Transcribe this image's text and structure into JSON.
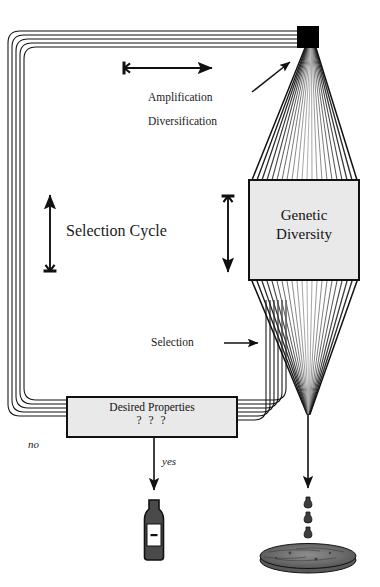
{
  "figure": {
    "labels": {
      "amplification": "Amplification",
      "diversification": "Diversification",
      "selection_cycle": "Selection Cycle",
      "selection": "Selection",
      "no": "no",
      "yes": "yes"
    },
    "boxes": {
      "genetic_diversity": {
        "line1": "Genetic",
        "line2": "Diversity"
      },
      "desired_properties": {
        "line1": "Desired Properties",
        "line2": "? ? ?"
      }
    },
    "icons": {
      "black_square": "black-square-node",
      "bottle": "bottle-icon",
      "petri_dish": "petri-dish-icon",
      "droplets": "droplet-icon"
    },
    "arrows": {
      "top_horizontal": "arrow-right",
      "diagonal_to_node": "arrow-diagonal-up-right",
      "left_vertical": "arrow-up",
      "right_vertical": "arrow-down",
      "selection_arrow": "arrow-right",
      "yes_arrow": "arrow-down",
      "dispense_arrow": "arrow-down"
    },
    "colors": {
      "ink": "#111111",
      "box_fill": "#e9e9e9",
      "node_fill": "#000000",
      "bottle_fill": "#4a4a4a",
      "dish_fill": "#6a6a6a"
    }
  }
}
